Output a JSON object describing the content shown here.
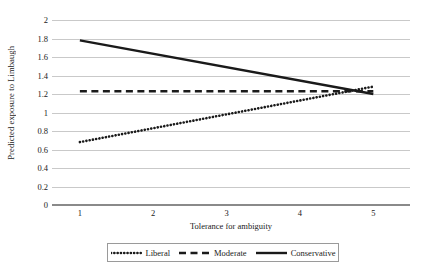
{
  "chart_data": {
    "type": "line",
    "title": "",
    "xlabel": "Tolerance for ambiguity",
    "ylabel": "Predicted exposure to Limbaugh",
    "x": [
      1,
      5
    ],
    "xlim": [
      0.62,
      5.5
    ],
    "ylim": [
      0,
      2
    ],
    "xticks": [
      "1",
      "2",
      "3",
      "4",
      "5"
    ],
    "xtick_values": [
      1,
      2,
      3,
      4,
      5
    ],
    "yticks": [
      "0",
      "0.2",
      "0.4",
      "0.6",
      "0.8",
      "1",
      "1.2",
      "1.4",
      "1.6",
      "1.8",
      "2"
    ],
    "ytick_values": [
      0,
      0.2,
      0.4,
      0.6,
      0.8,
      1,
      1.2,
      1.4,
      1.6,
      1.8,
      2
    ],
    "grid": true,
    "legend_position": "bottom",
    "series": [
      {
        "name": "Liberal",
        "style": "dotted",
        "color": "#1a1a1a",
        "x": [
          1,
          5
        ],
        "values": [
          0.68,
          1.28
        ]
      },
      {
        "name": "Moderate",
        "style": "dashed",
        "color": "#1a1a1a",
        "x": [
          1,
          5
        ],
        "values": [
          1.23,
          1.23
        ]
      },
      {
        "name": "Conservative",
        "style": "solid",
        "color": "#1a1a1a",
        "x": [
          1,
          5
        ],
        "values": [
          1.78,
          1.2
        ]
      }
    ]
  },
  "axes": {
    "y_title": "Predicted exposure to Limbaugh",
    "x_title": "Tolerance for ambiguity",
    "y_tick_labels": [
      "2",
      "1.8",
      "1.6",
      "1.4",
      "1.2",
      "1",
      "0.8",
      "0.6",
      "0.4",
      "0.2",
      "0"
    ],
    "x_tick_labels": [
      "1",
      "2",
      "3",
      "4",
      "5"
    ]
  },
  "legend": {
    "items": [
      {
        "label": "Liberal",
        "style": "dotted"
      },
      {
        "label": "Moderate",
        "style": "dashed"
      },
      {
        "label": "Conservative",
        "style": "solid"
      }
    ]
  },
  "colors": {
    "line": "#1a1a1a",
    "grid": "#c9c9c9",
    "axis": "#8a8a8a",
    "background": "#ffffff"
  }
}
